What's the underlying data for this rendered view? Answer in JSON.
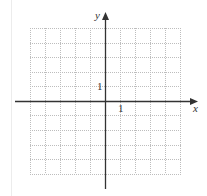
{
  "diagram": {
    "type": "coordinate-grid",
    "axes": {
      "x_label": "x",
      "y_label": "y",
      "x_tick_label": "1",
      "y_tick_label": "1"
    },
    "grid": {
      "columns": 10,
      "rows": 10,
      "x_range": [
        -5,
        5
      ],
      "y_range": [
        -5,
        5
      ],
      "line_style": "dotted"
    },
    "colors": {
      "axis": "#333333",
      "grid": "#bbbbbb"
    }
  }
}
